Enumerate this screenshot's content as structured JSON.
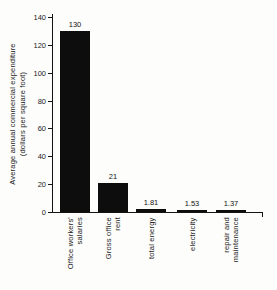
{
  "chart_data": {
    "type": "bar",
    "title": "",
    "ylabel_line1": "Average annual commercial expenditure",
    "ylabel_line2": "(dollars per square foot)",
    "categories": [
      "Office workers' salaries",
      "Gross office rent",
      "total energy",
      "electricity",
      "repair and maintenance"
    ],
    "category_lines": [
      [
        "Office workers'",
        "salaries"
      ],
      [
        "Gross office",
        "rent"
      ],
      [
        "total energy"
      ],
      [
        "electricity"
      ],
      [
        "repair and",
        "maintenance"
      ]
    ],
    "values": [
      130,
      21,
      1.81,
      1.53,
      1.37
    ],
    "value_labels": [
      "130",
      "21",
      "1.81",
      "1.53",
      "1.37"
    ],
    "yticks": [
      0,
      20,
      40,
      60,
      80,
      100,
      120,
      140
    ],
    "ylim": [
      0,
      140
    ],
    "xlabel": "",
    "ylabel": "Average annual commercial expenditure (dollars per square foot)",
    "bar_color": "#0d0d0d",
    "background": "#fdfdfb",
    "grid": false,
    "legend": false
  }
}
